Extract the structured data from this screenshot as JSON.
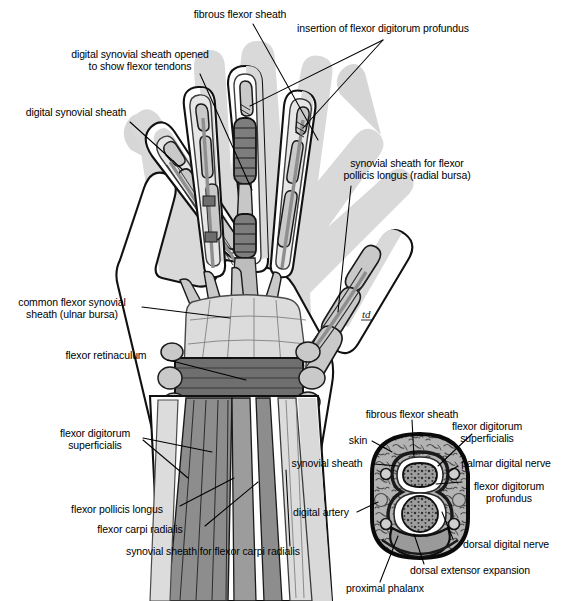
{
  "figure": {
    "artist_monogram": "td",
    "colors": {
      "outline": "#000000",
      "skin_shadow": "#d9d9d9",
      "skin_fill": "#ffffff",
      "bone_fill": "#c6c6c6",
      "bone_light": "#dedede",
      "sheath_fill": "#e3e3e3",
      "tendon_dark": "#8a8a8a",
      "tendon_mid": "#a8a8a8",
      "retinaculum": "#6f6f6f",
      "aponeurosis": "#dcdcdc",
      "cross_section_fill": "#b0b0b0",
      "cross_section_dark": "#7a7a7a",
      "background": "#ffffff"
    }
  },
  "labels": {
    "hand": [
      {
        "id": "fibrous-flexor-sheath",
        "lines": [
          "fibrous flexor sheath"
        ],
        "x": 240,
        "y": 14,
        "align": "center"
      },
      {
        "id": "insertion-of-flexor-digitorum-profundus",
        "lines": [
          "insertion of flexor digitorum profundus"
        ],
        "x": 383,
        "y": 28,
        "align": "center"
      },
      {
        "id": "digital-synovial-sheath-opened",
        "lines": [
          "digital synovial sheath opened",
          "to show flexor tendons"
        ],
        "x": 140,
        "y": 54,
        "align": "center"
      },
      {
        "id": "digital-synovial-sheath",
        "lines": [
          "digital synovial sheath"
        ],
        "x": 76,
        "y": 112,
        "align": "center"
      },
      {
        "id": "synovial-sheath-for-flexor-pollicis-longus",
        "lines": [
          "synovial sheath for flexor",
          "pollicis longus (radial bursa)",
          ""
        ],
        "x": 407,
        "y": 163,
        "align": "center"
      },
      {
        "id": "common-flexor-synovial-sheath",
        "lines": [
          "common flexor synovial",
          "sheath (ulnar bursa)"
        ],
        "x": 71,
        "y": 302,
        "align": "center"
      },
      {
        "id": "flexor-retinaculum",
        "lines": [
          "flexor retinaculum"
        ],
        "x": 106,
        "y": 355,
        "align": "center"
      },
      {
        "id": "flexor-digitorum-superficialis",
        "lines": [
          "flexor digitorum",
          "superficialis"
        ],
        "x": 95,
        "y": 433,
        "align": "center"
      },
      {
        "id": "flexor-pollicis-longus",
        "lines": [
          "flexor pollicis longus"
        ],
        "x": 117,
        "y": 509,
        "align": "center"
      },
      {
        "id": "flexor-carpi-radialis",
        "lines": [
          "flexor carpi radialis"
        ],
        "x": 140,
        "y": 529,
        "align": "center"
      },
      {
        "id": "synovial-sheath-for-flexor-carpi-radialis",
        "lines": [
          "synovial sheath for flexor carpi radialis"
        ],
        "x": 213,
        "y": 551,
        "align": "center"
      }
    ],
    "cross_section": [
      {
        "id": "fibrous-flexor-sheath-cs",
        "lines": [
          "fibrous flexor sheath"
        ],
        "x": 412,
        "y": 414,
        "align": "center"
      },
      {
        "id": "flexor-digitorum-superficialis-cs",
        "lines": [
          "flexor digitorum",
          "superficialis"
        ],
        "x": 487,
        "y": 426,
        "align": "center"
      },
      {
        "id": "skin",
        "lines": [
          "skin"
        ],
        "x": 358,
        "y": 440,
        "align": "center"
      },
      {
        "id": "synovial-sheath",
        "lines": [
          "synovial sheath"
        ],
        "x": 327,
        "y": 463,
        "align": "center"
      },
      {
        "id": "palmar-digital-nerve",
        "lines": [
          "palmar digital nerve"
        ],
        "x": 506,
        "y": 463,
        "align": "center"
      },
      {
        "id": "flexor-digitorum-profundus-cs",
        "lines": [
          "flexor digitorum",
          "profundus"
        ],
        "x": 509,
        "y": 486,
        "align": "center"
      },
      {
        "id": "digital-artery",
        "lines": [
          "digital artery"
        ],
        "x": 320,
        "y": 512,
        "align": "center"
      },
      {
        "id": "dorsal-digital-nerve",
        "lines": [
          "dorsal digital nerve"
        ],
        "x": 506,
        "y": 544,
        "align": "center"
      },
      {
        "id": "dorsal-extensor-expansion",
        "lines": [
          "dorsal extensor expansion"
        ],
        "x": 470,
        "y": 570,
        "align": "center"
      },
      {
        "id": "proximal-phalanx",
        "lines": [
          "proximal phalanx"
        ],
        "x": 385,
        "y": 588,
        "align": "center"
      }
    ]
  }
}
